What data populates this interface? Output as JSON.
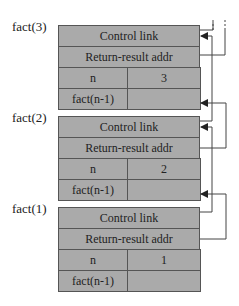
{
  "frames": [
    {
      "label": "fact(3)",
      "control_link": "Control link",
      "return_result": "Return-result addr",
      "n_label": "n",
      "n_value": "3",
      "fact_label": "fact(n-1)",
      "fact_value": ""
    },
    {
      "label": "fact(2)",
      "control_link": "Control link",
      "return_result": "Return-result addr",
      "n_label": "n",
      "n_value": "2",
      "fact_label": "fact(n-1)",
      "fact_value": ""
    },
    {
      "label": "fact(1)",
      "control_link": "Control link",
      "return_result": "Return-result addr",
      "n_label": "n",
      "n_value": "1",
      "fact_label": "fact(n-1)",
      "fact_value": ""
    }
  ],
  "colors": {
    "cell_fill": "#aaaaaa",
    "border": "#555555",
    "connector": "#444444"
  }
}
